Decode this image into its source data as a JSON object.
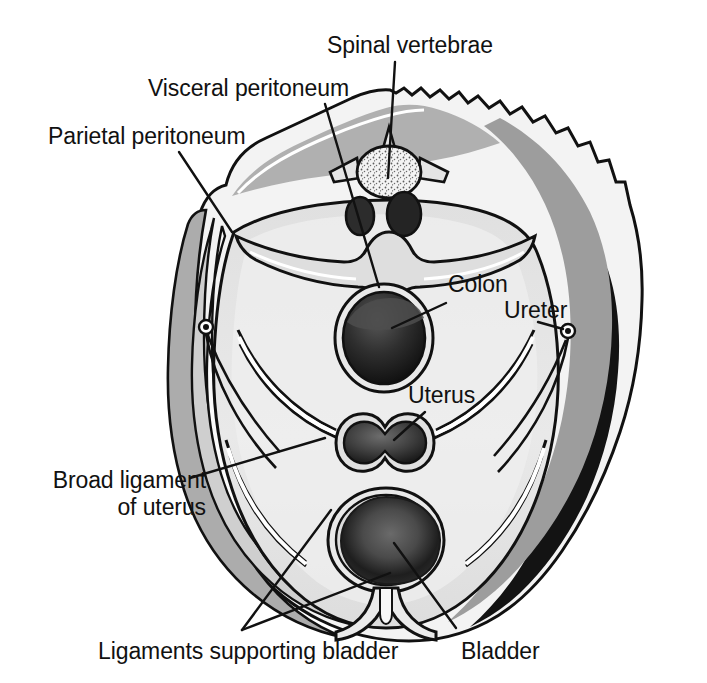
{
  "figure": {
    "type": "anatomical-cross-section",
    "background_color": "#ffffff",
    "ink_color": "#111111",
    "palette": {
      "outer_skin": "#f2f2f2",
      "muscle_mid_gray": "#a8a8a8",
      "muscle_dark_gray": "#8f8f8f",
      "deep_black": "#111111",
      "cavity_light": "#e4e4e4",
      "cavity_lighter": "#ededed",
      "organ_dark": "#3a3a3a",
      "organ_mid": "#5a5a5a",
      "bone_speckle": "#f6f6f6",
      "white_line": "#ffffff"
    }
  },
  "labels": [
    {
      "id": "spinal-vertebrae",
      "text": "Spinal vertebrae",
      "x": 327,
      "y": 32,
      "align": "left",
      "leader": [
        [
          395,
          62
        ],
        [
          388,
          178
        ]
      ]
    },
    {
      "id": "visceral-peritoneum",
      "text": "Visceral peritoneum",
      "x": 148,
      "y": 75,
      "align": "left",
      "leader": [
        [
          325,
          104
        ],
        [
          379,
          287
        ]
      ]
    },
    {
      "id": "parietal-peritoneum",
      "text": "Parietal peritoneum",
      "x": 48,
      "y": 123,
      "align": "left",
      "leader": [
        [
          179,
          152
        ],
        [
          232,
          232
        ]
      ]
    },
    {
      "id": "colon",
      "text": "Colon",
      "x": 448,
      "y": 271,
      "align": "left",
      "leader": [
        [
          446,
          303
        ],
        [
          392,
          328
        ]
      ]
    },
    {
      "id": "ureter",
      "text": "Ureter",
      "x": 504,
      "y": 297,
      "align": "left",
      "leader": [
        [
          538,
          322
        ],
        [
          568,
          332
        ]
      ]
    },
    {
      "id": "uterus",
      "text": "Uterus",
      "x": 408,
      "y": 382,
      "align": "left",
      "leader": [
        [
          425,
          412
        ],
        [
          394,
          440
        ]
      ]
    },
    {
      "id": "broad-ligament-of-uterus",
      "text": "Broad ligament\nof uterus",
      "x": 36,
      "y": 467,
      "align": "left",
      "leader": [
        [
          190,
          478
        ],
        [
          325,
          438
        ]
      ]
    },
    {
      "id": "ligaments-supporting-bladder",
      "text": "Ligaments supporting bladder",
      "x": 98,
      "y": 638,
      "align": "left",
      "leader_fan": [
        [
          [
            242,
            630
          ],
          [
            331,
            510
          ]
        ],
        [
          [
            242,
            630
          ],
          [
            390,
            573
          ]
        ]
      ]
    },
    {
      "id": "bladder",
      "text": "Bladder",
      "x": 461,
      "y": 638,
      "align": "left",
      "leader": [
        [
          456,
          628
        ],
        [
          394,
          543
        ]
      ]
    }
  ]
}
